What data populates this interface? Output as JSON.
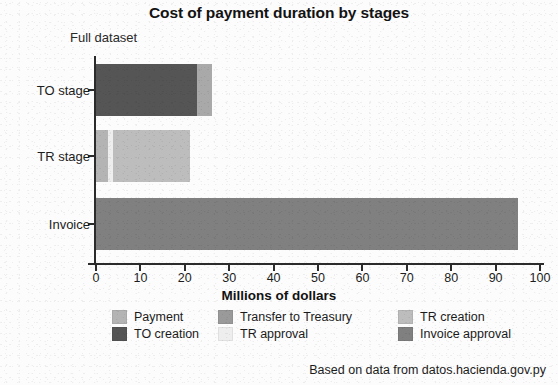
{
  "chart_data": {
    "type": "bar",
    "orientation": "horizontal",
    "stacked": true,
    "title": "Cost of payment duration by stages",
    "subtitle": "Full dataset",
    "xlabel": "Millions of dollars",
    "ylabel": "",
    "xlim": [
      0,
      100
    ],
    "xticks": [
      0,
      10,
      20,
      30,
      40,
      50,
      60,
      70,
      80,
      90,
      100
    ],
    "grid": false,
    "legend_position": "bottom",
    "categories": [
      "TO stage",
      "TR stage",
      "Invoice"
    ],
    "series": [
      {
        "name": "Payment",
        "color": "#b4b4b4",
        "values": [
          0,
          2.8,
          0
        ]
      },
      {
        "name": "Transfer to Treasury",
        "color": "#9a9a9a",
        "values": [
          0,
          0,
          0
        ]
      },
      {
        "name": "TR creation",
        "color": "#bdbdbd",
        "values": [
          0,
          17.3,
          0
        ]
      },
      {
        "name": "TO creation",
        "color": "#555555",
        "values": [
          22.7,
          0,
          0
        ]
      },
      {
        "name": "TR approval",
        "color": "#eeeeee",
        "values": [
          0,
          1.1,
          0
        ]
      },
      {
        "name": "Invoice approval",
        "color": "#808080",
        "values": [
          3.4,
          0,
          95.0
        ]
      }
    ],
    "bars": [
      {
        "category": "TO stage",
        "total": 26.1,
        "segments": [
          {
            "series": "TO creation",
            "value": 22.7,
            "color": "#555555"
          },
          {
            "series": "Invoice approval",
            "value": 3.4,
            "color": "#a9a9a9"
          }
        ]
      },
      {
        "category": "TR stage",
        "total": 21.2,
        "segments": [
          {
            "series": "Payment",
            "value": 2.8,
            "color": "#b4b4b4"
          },
          {
            "series": "TR approval",
            "value": 1.1,
            "color": "#eeeeee"
          },
          {
            "series": "TR creation",
            "value": 17.3,
            "color": "#bdbdbd"
          }
        ]
      },
      {
        "category": "Invoice",
        "total": 95.0,
        "segments": [
          {
            "series": "Invoice approval",
            "value": 95.0,
            "color": "#808080"
          }
        ]
      }
    ]
  },
  "legend": {
    "rows": [
      [
        {
          "label": "Payment",
          "color": "#b4b4b4"
        },
        {
          "label": "Transfer to Treasury",
          "color": "#9a9a9a"
        },
        {
          "label": "TR creation",
          "color": "#bdbdbd"
        }
      ],
      [
        {
          "label": "TO creation",
          "color": "#555555"
        },
        {
          "label": "TR approval",
          "color": "#eeeeee"
        },
        {
          "label": "Invoice approval",
          "color": "#808080"
        }
      ]
    ]
  },
  "footer": {
    "note": "Based on data from datos.hacienda.gov.py"
  }
}
